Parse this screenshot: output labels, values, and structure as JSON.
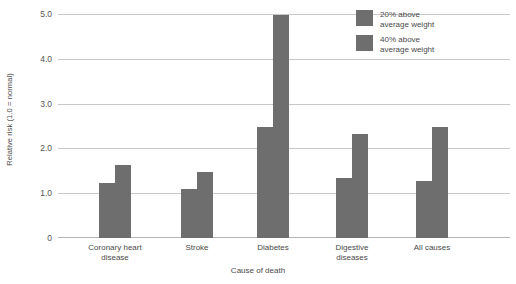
{
  "chart_data": {
    "type": "bar",
    "title": "",
    "xlabel": "Cause of death",
    "ylabel": "Relative risk (1.0 = normal)",
    "categories": [
      "Coronary heart\ndisease",
      "Stroke",
      "Diabetes",
      "Digestive\ndiseases",
      "All causes"
    ],
    "series": [
      {
        "name": "20% above\naverage weight",
        "values": [
          1.23,
          1.1,
          2.5,
          1.35,
          1.27
        ]
      },
      {
        "name": "40% above\naverage weight",
        "values": [
          1.63,
          1.47,
          5.0,
          2.33,
          2.48
        ]
      }
    ],
    "ylim": [
      0,
      5.0
    ],
    "yticks": [
      "0",
      "1.0",
      "2.0",
      "3.0",
      "4.0",
      "5.0"
    ],
    "ytick_values": [
      0,
      1.0,
      2.0,
      3.0,
      4.0,
      5.0
    ],
    "grid": true,
    "legend_position": "top-right",
    "colors": {
      "bar_20": "#6e6e6e",
      "bar_40": "#6e6e6e",
      "gridline": "#c8c8c8",
      "text": "#4a4a4a",
      "background": "#ffffff"
    }
  }
}
